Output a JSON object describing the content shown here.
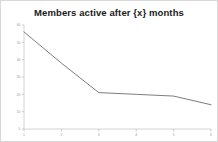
{
  "chart_data": {
    "type": "line",
    "title": "Members active after {x} months",
    "xlabel": "",
    "ylabel": "",
    "x": [
      1,
      2,
      3,
      4,
      5,
      6
    ],
    "categories": [
      "1",
      "2",
      "3",
      "4",
      "5",
      "6"
    ],
    "series": [
      {
        "name": "Members active",
        "values": [
          56,
          38,
          21,
          20,
          19,
          14
        ]
      }
    ],
    "xlim": [
      1,
      6
    ],
    "ylim": [
      0,
      60
    ],
    "ytick_values": [
      0,
      10,
      20,
      30,
      40,
      50,
      60
    ],
    "ytick_labels": [
      "0",
      "10",
      "20",
      "30",
      "40",
      "50",
      "60"
    ],
    "xtick_labels": [
      "1",
      "2",
      "3",
      "4",
      "5",
      "6"
    ],
    "grid": false,
    "legend": false,
    "legend_position": "none",
    "line_color": "#6e6e6e",
    "axis_color": "#c9c9c9",
    "tick_label_color": "#9a9a9a",
    "title_color": "#1a1a1a",
    "border_color": "#d8d8d8",
    "background_color": "#ffffff"
  }
}
